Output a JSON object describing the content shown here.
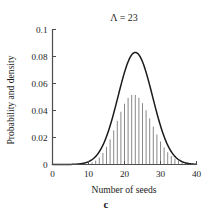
{
  "figure": {
    "panel_caption": "c"
  },
  "chart_data": {
    "type": "bar",
    "title": "Λ = 23",
    "xlabel": "Number of seeds",
    "ylabel": "Probability and density",
    "xlim": [
      0,
      40
    ],
    "ylim": [
      0,
      0.1
    ],
    "xticks": [
      0,
      10,
      20,
      30,
      40
    ],
    "xtick_labels": [
      "0",
      "10",
      "20",
      "30",
      "40"
    ],
    "yticks": [
      0,
      0.02,
      0.04,
      0.06,
      0.08,
      0.1
    ],
    "ytick_labels": [
      "0",
      "0.02",
      "0.04",
      "0.06",
      "0.08",
      "0.1"
    ],
    "grid": false,
    "legend": null,
    "bar_color": "#7a7a7a",
    "line_color": "#1a1a1a",
    "axis_color": "#4d4d4d",
    "series": [
      {
        "name": "Probability (Poisson spikes)",
        "type": "bar",
        "x": [
          8,
          9,
          10,
          11,
          12,
          13,
          14,
          15,
          16,
          17,
          18,
          19,
          20,
          21,
          22,
          23,
          24,
          25,
          26,
          27,
          28,
          29,
          30,
          31,
          32,
          33,
          34,
          35,
          36,
          37
        ],
        "values": [
          0.0001,
          0.0003,
          0.0007,
          0.0015,
          0.0029,
          0.0052,
          0.0085,
          0.013,
          0.0187,
          0.0253,
          0.0323,
          0.0391,
          0.045,
          0.0493,
          0.0515,
          0.0515,
          0.0494,
          0.0454,
          0.0402,
          0.0342,
          0.0281,
          0.0223,
          0.0171,
          0.0127,
          0.0091,
          0.0063,
          0.0043,
          0.0028,
          0.0018,
          0.0011
        ]
      },
      {
        "name": "Density (normal approximation)",
        "type": "line",
        "mean": 23,
        "sigma": 4.8,
        "peak_x": 23,
        "peak_y": 0.083,
        "x": [
          0,
          2,
          4,
          6,
          8,
          10,
          12,
          14,
          16,
          18,
          20,
          22,
          23,
          24,
          26,
          28,
          30,
          32,
          34,
          36,
          38,
          40
        ],
        "values": [
          0.0,
          0.0,
          0.0001,
          0.0004,
          0.0015,
          0.0047,
          0.0122,
          0.0262,
          0.0461,
          0.0665,
          0.0789,
          0.083,
          0.0831,
          0.0826,
          0.0735,
          0.0562,
          0.0371,
          0.0209,
          0.0101,
          0.0042,
          0.0014,
          0.0004
        ]
      }
    ]
  }
}
